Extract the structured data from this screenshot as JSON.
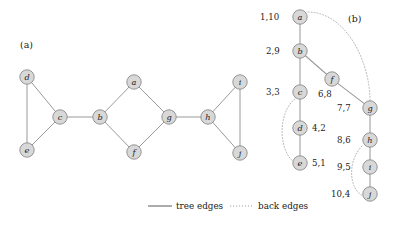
{
  "figure": {
    "panel_a": {
      "caption": "(a)",
      "caption_x": 20,
      "caption_y": 48,
      "nodes": [
        {
          "id": "d",
          "label": "d",
          "x": 27,
          "y": 77
        },
        {
          "id": "e",
          "label": "e",
          "x": 27,
          "y": 150
        },
        {
          "id": "c",
          "label": "c",
          "x": 60,
          "y": 117
        },
        {
          "id": "b",
          "label": "b",
          "x": 100,
          "y": 117
        },
        {
          "id": "a",
          "label": "a",
          "x": 134,
          "y": 82
        },
        {
          "id": "f",
          "label": "f",
          "x": 134,
          "y": 152
        },
        {
          "id": "g",
          "label": "g",
          "x": 169,
          "y": 117
        },
        {
          "id": "h",
          "label": "h",
          "x": 208,
          "y": 117
        },
        {
          "id": "i",
          "label": "i",
          "x": 240,
          "y": 82
        },
        {
          "id": "j",
          "label": "j",
          "x": 240,
          "y": 153
        }
      ],
      "edges": [
        {
          "from": "d",
          "to": "e"
        },
        {
          "from": "d",
          "to": "c"
        },
        {
          "from": "e",
          "to": "c"
        },
        {
          "from": "c",
          "to": "b"
        },
        {
          "from": "b",
          "to": "a"
        },
        {
          "from": "b",
          "to": "f"
        },
        {
          "from": "a",
          "to": "g"
        },
        {
          "from": "f",
          "to": "g"
        },
        {
          "from": "g",
          "to": "h"
        },
        {
          "from": "h",
          "to": "i"
        },
        {
          "from": "h",
          "to": "j"
        },
        {
          "from": "i",
          "to": "j"
        }
      ]
    },
    "panel_b": {
      "caption": "(b)",
      "caption_x": 348,
      "caption_y": 22,
      "nodes": [
        {
          "id": "a",
          "label": "a",
          "x": 300,
          "y": 17,
          "times": "1,10",
          "tx": 260,
          "ty": 20
        },
        {
          "id": "b",
          "label": "b",
          "x": 300,
          "y": 51,
          "times": "2,9",
          "tx": 266,
          "ty": 54
        },
        {
          "id": "c",
          "label": "c",
          "x": 300,
          "y": 92,
          "times": "3,3",
          "tx": 266,
          "ty": 95
        },
        {
          "id": "d",
          "label": "d",
          "x": 300,
          "y": 128,
          "times": "4,2",
          "tx": 312,
          "ty": 131
        },
        {
          "id": "e",
          "label": "e",
          "x": 300,
          "y": 163,
          "times": "5,1",
          "tx": 312,
          "ty": 166
        },
        {
          "id": "f",
          "label": "f",
          "x": 332,
          "y": 79,
          "times": "6,8",
          "tx": 318,
          "ty": 97
        },
        {
          "id": "g",
          "label": "g",
          "x": 370,
          "y": 108,
          "times": "7,7",
          "tx": 337,
          "ty": 111
        },
        {
          "id": "h",
          "label": "h",
          "x": 370,
          "y": 140,
          "times": "8,6",
          "tx": 337,
          "ty": 143
        },
        {
          "id": "i",
          "label": "i",
          "x": 370,
          "y": 167,
          "times": "9,5",
          "tx": 337,
          "ty": 170
        },
        {
          "id": "j",
          "label": "j",
          "x": 370,
          "y": 194,
          "times": "10,4",
          "tx": 331,
          "ty": 197
        }
      ],
      "tree_edges": [
        {
          "from": "a",
          "to": "b"
        },
        {
          "from": "b",
          "to": "c"
        },
        {
          "from": "b",
          "to": "f"
        },
        {
          "from": "c",
          "to": "d"
        },
        {
          "from": "d",
          "to": "e"
        },
        {
          "from": "f",
          "to": "g"
        },
        {
          "from": "g",
          "to": "h"
        },
        {
          "from": "h",
          "to": "i"
        },
        {
          "from": "i",
          "to": "j"
        }
      ],
      "back_edges": [
        {
          "from": "a",
          "to": "g",
          "path": "M 308 12 C 345 12 370 60 370 101"
        },
        {
          "from": "c",
          "to": "e",
          "path": "M 295 99 C 278 112 278 150 294 162"
        },
        {
          "from": "h",
          "to": "j",
          "path": "M 362 146 C 348 160 348 188 363 196"
        }
      ]
    },
    "legend": {
      "tree_edges_label": "tree edges",
      "back_edges_label": "back edges",
      "tree_line_x1": 148,
      "tree_line_x2": 172,
      "tree_text_x": 176,
      "back_line_x1": 230,
      "back_line_x2": 254,
      "back_text_x": 258,
      "y": 209
    },
    "style": {
      "node_radius": 7.2,
      "node_fill": "#d8d8d8",
      "node_stroke": "#8a8a8a",
      "edge_color": "#9a9a9a",
      "back_edge_color": "#b4b4b4",
      "text_color": "#1b1b1b",
      "background": "#ffffff"
    }
  }
}
